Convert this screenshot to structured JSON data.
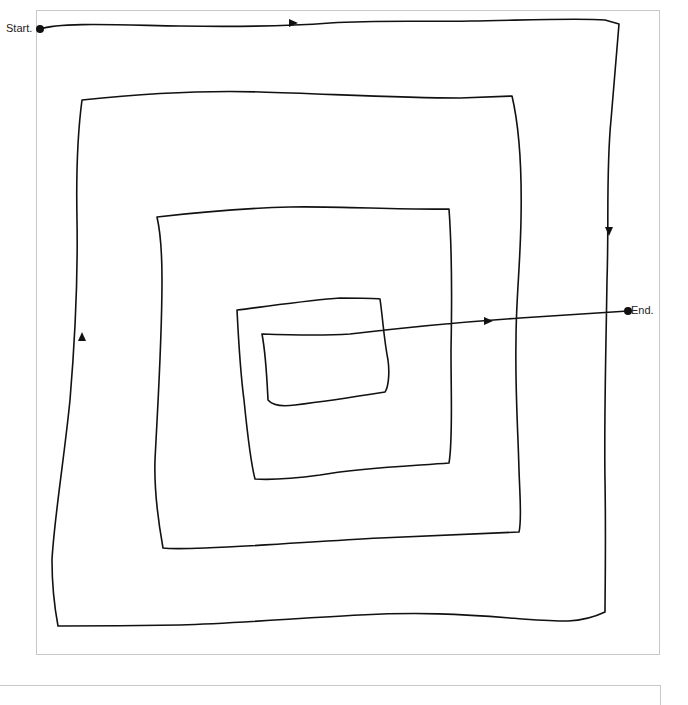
{
  "diagram": {
    "title": "",
    "type": "spiral-path",
    "start_label": "Start.",
    "end_label": "End.",
    "line_color": "#111111",
    "frame_color": "#c8c8c8",
    "direction_arrows": [
      {
        "position": "top edge, outer ring",
        "direction": "right"
      },
      {
        "position": "right edge, outer ring",
        "direction": "down"
      },
      {
        "position": "left edge, second ring",
        "direction": "up"
      },
      {
        "position": "exit line toward End",
        "direction": "right"
      }
    ]
  }
}
